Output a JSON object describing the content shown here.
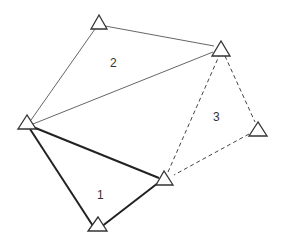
{
  "diagram": {
    "type": "triangulation-network",
    "colors": {
      "line": "#555555",
      "thick_line": "#222222",
      "station_stroke": "#333333",
      "station_fill": "#ffffff",
      "label": "#333333"
    },
    "stations": [
      {
        "id": "A",
        "cx": 99,
        "cy": 23
      },
      {
        "id": "B",
        "cx": 221,
        "cy": 49
      },
      {
        "id": "C",
        "cx": 27,
        "cy": 123
      },
      {
        "id": "D",
        "cx": 258,
        "cy": 130
      },
      {
        "id": "E",
        "cx": 164,
        "cy": 179
      },
      {
        "id": "F",
        "cx": 98,
        "cy": 225
      }
    ],
    "triangle_labels": [
      {
        "text": "2",
        "x": 110,
        "y": 67
      },
      {
        "text": "3",
        "x": 213,
        "y": 121
      },
      {
        "text": "1",
        "x": 97,
        "y": 199
      }
    ]
  }
}
